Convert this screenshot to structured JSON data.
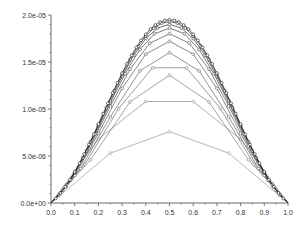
{
  "chart_data": {
    "type": "line",
    "title": "",
    "xlabel": "",
    "ylabel": "",
    "xlim": [
      0.0,
      1.0
    ],
    "ylim": [
      0.0,
      2e-05
    ],
    "grid": false,
    "legend": null,
    "x_ticks": [
      "0.0",
      "0.1",
      "0.2",
      "0.3",
      "0.4",
      "0.5",
      "0.6",
      "0.7",
      "0.8",
      "0.9",
      "1.0"
    ],
    "y_ticks": [
      "0.0e+00",
      "5.0e-06",
      "1.0e-05",
      "1.5e-05",
      "2.0e-05"
    ],
    "marker": "open-circle",
    "series": [
      {
        "name": "n=4",
        "x": [
          0,
          0.25,
          0.5,
          0.75,
          1
        ],
        "y": [
          0,
          5.3e-06,
          7.6e-06,
          5.3e-06,
          0
        ]
      },
      {
        "name": "n=5",
        "x": [
          0,
          0.2,
          0.4,
          0.6,
          0.8,
          1
        ],
        "y": [
          0,
          6.8e-06,
          1.08e-05,
          1.08e-05,
          6.8e-06,
          0
        ]
      },
      {
        "name": "n=6",
        "peak": 1.36e-05
      },
      {
        "name": "n=7",
        "peak": 1.5e-05
      },
      {
        "name": "n=8",
        "peak": 1.6e-05
      },
      {
        "name": "n=10",
        "peak": 1.72e-05
      },
      {
        "name": "n=12",
        "peak": 1.8e-05
      },
      {
        "name": "n=16",
        "peak": 1.86e-05
      },
      {
        "name": "n=20",
        "peak": 1.9e-05
      },
      {
        "name": "n=30",
        "peak": 1.93e-05
      },
      {
        "name": "n=50",
        "peak": 1.95e-05
      }
    ]
  }
}
